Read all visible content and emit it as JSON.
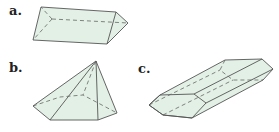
{
  "figures": [
    {
      "label": "a.",
      "shape": "triangular prism"
    },
    {
      "label": "b.",
      "shape": "pentagonal pyramid"
    },
    {
      "label": "c.",
      "shape": "hexagonal prism"
    }
  ],
  "colors": {
    "fill": "#e3f0e6",
    "stroke": "#555555"
  }
}
